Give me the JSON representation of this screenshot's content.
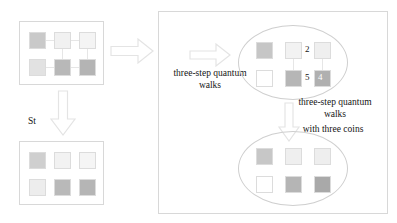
{
  "figure": {
    "background": "#ffffff"
  },
  "palette": {
    "cell_border": "#dcdcdc",
    "ellipse_border": "#cfcfcf",
    "panel_border": "#d8d8d8",
    "arrow_fill": "#ffffff",
    "arrow_stroke": "#e4e4e4",
    "text": "#141414"
  },
  "left_column": {
    "initial_box": {
      "name": "initial-lattice",
      "cells": [
        {
          "index": 0,
          "color": "#c9c9c9"
        },
        {
          "index": 1,
          "color": "#f1f1f1"
        },
        {
          "index": 2,
          "color": "#f4f4f4"
        },
        {
          "index": 3,
          "color": "#e2e2e2"
        },
        {
          "index": 4,
          "color": "#b8b8b8"
        },
        {
          "index": 5,
          "color": "#b4b4b4"
        }
      ]
    },
    "shift_label": "St",
    "shifted_box": {
      "name": "shifted-lattice",
      "cells": [
        {
          "index": 0,
          "color": "#cfcfcf"
        },
        {
          "index": 1,
          "color": "#f2f2f2"
        },
        {
          "index": 2,
          "color": "#f5f5f5"
        },
        {
          "index": 3,
          "color": "#ededed"
        },
        {
          "index": 4,
          "color": "#b9b9b9"
        },
        {
          "index": 5,
          "color": "#b5b5b5"
        }
      ]
    }
  },
  "arrows": {
    "main_right": "arrow-right",
    "left_down": "arrow-down",
    "inner_right": "arrow-right",
    "inner_down": "arrow-down"
  },
  "right_panel": {
    "caption_left": {
      "line1": "three-step quantum",
      "line2": "walks"
    },
    "caption_right": {
      "line1": "three-step quantum",
      "line2": "walks",
      "line3": "with three coins"
    },
    "ellipse_top": {
      "name": "state-after-three-step-walks",
      "cells": [
        {
          "index": 0,
          "color": "#c6c6c6",
          "label": ""
        },
        {
          "index": 1,
          "color": "#f2f2f2",
          "label": ""
        },
        {
          "index": 2,
          "color": "#efefef",
          "label": ""
        },
        {
          "index": 3,
          "color": "#ffffff",
          "label": ""
        },
        {
          "index": 4,
          "color": "#b6b6b6",
          "label": ""
        },
        {
          "index": 5,
          "color": "#b0b0b0",
          "label": "4"
        }
      ],
      "numbers": [
        {
          "value": "2",
          "near_cell": 1
        },
        {
          "value": "5",
          "near_cell": 4
        },
        {
          "value": "4",
          "near_cell": 5
        }
      ]
    },
    "ellipse_bottom": {
      "name": "state-after-three-coin-walks",
      "cells": [
        {
          "index": 0,
          "color": "#c7c7c7"
        },
        {
          "index": 1,
          "color": "#efefef"
        },
        {
          "index": 2,
          "color": "#eeeeee"
        },
        {
          "index": 3,
          "color": "#ffffff"
        },
        {
          "index": 4,
          "color": "#b5b5b5"
        },
        {
          "index": 5,
          "color": "#a9a9a9"
        }
      ]
    }
  }
}
